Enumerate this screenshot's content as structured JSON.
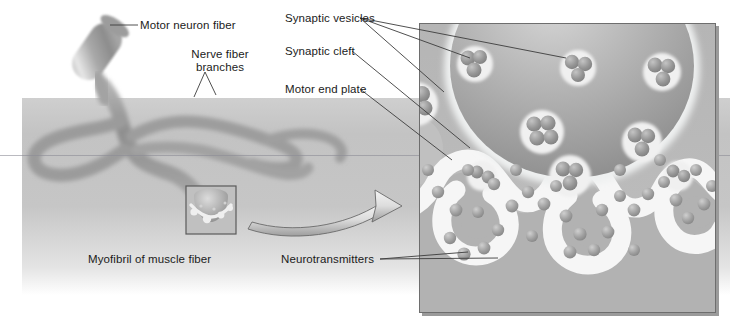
{
  "figure": {
    "type": "biological-illustration"
  },
  "labels": [
    {
      "id": "motor-neuron-fiber",
      "text": "Motor neuron fiber",
      "x": 140,
      "y": 19,
      "align": "left"
    },
    {
      "id": "nerve-fiber-branches",
      "text": "Nerve fiber\nbranches",
      "x": 188,
      "y": 55,
      "align": "center"
    },
    {
      "id": "synaptic-vesicles",
      "text": "Synaptic vesicles",
      "x": 285,
      "y": 12,
      "align": "left"
    },
    {
      "id": "synaptic-cleft",
      "text": "Synaptic cleft",
      "x": 285,
      "y": 46,
      "align": "left"
    },
    {
      "id": "motor-end-plate",
      "text": "Motor end plate",
      "x": 285,
      "y": 83,
      "align": "left"
    },
    {
      "id": "myofibril-of-muscle-fiber",
      "text": "Myofibril of muscle fiber",
      "x": 88,
      "y": 253,
      "align": "left"
    },
    {
      "id": "neurotransmitters",
      "text": "Neurotransmitters",
      "x": 281,
      "y": 253,
      "align": "left"
    }
  ],
  "colors": {
    "background": "#ffffff",
    "muscle_band": "#c4c4c4",
    "nerve_fiber": "#9a9a9a",
    "nerve_fiber_light": "#c9c9c9",
    "inset_background": "#b9b9b9",
    "synaptic_knob": "#a8a8a8",
    "cleft": "#f2f2f2",
    "vesicle": "#8f8f8f",
    "neurotransmitter": "#9c9c9c",
    "label_text": "#1b1b1b",
    "leader_line": "#4a4a4a",
    "frame_border": "#6e6e6e",
    "arrow_fill": "#d8d8d8",
    "arrow_stroke": "#6a6a6a",
    "magnifier_box_border": "#5a5a5a",
    "scan_line": "#7f7f8a"
  },
  "regions": {
    "muscle_band": {
      "x": 22,
      "y": 98,
      "width": 708,
      "height": 197
    },
    "inset_panel": {
      "x": 419,
      "y": 23,
      "width": 297,
      "height": 290
    },
    "magnifier_box": {
      "x": 186,
      "y": 186,
      "width": 50,
      "height": 48
    },
    "zoom_arrow": {
      "from_x": 248,
      "from_y": 228,
      "to_x": 400,
      "to_y": 206
    },
    "scan_line_y": 155
  },
  "structures": [
    {
      "name": "motor-neuron-fiber",
      "description": "myelinated axon cylinder entering from upper left"
    },
    {
      "name": "nerve-fiber-branches",
      "description": "terminal branches spreading across muscle fiber"
    },
    {
      "name": "synaptic-knob",
      "description": "large bulb in inset containing vesicles"
    },
    {
      "name": "synaptic-vesicles",
      "description": "clusters of neurotransmitter-filled sacs"
    },
    {
      "name": "synaptic-cleft",
      "description": "light gap between neuron and muscle membrane"
    },
    {
      "name": "motor-end-plate",
      "description": "folded muscle membrane below the cleft"
    },
    {
      "name": "neurotransmitters",
      "description": "individual spheres released into the cleft"
    }
  ],
  "counts": {
    "vesicle_clusters": 11,
    "free_neurotransmitters": 34,
    "end_plate_folds": 3
  }
}
